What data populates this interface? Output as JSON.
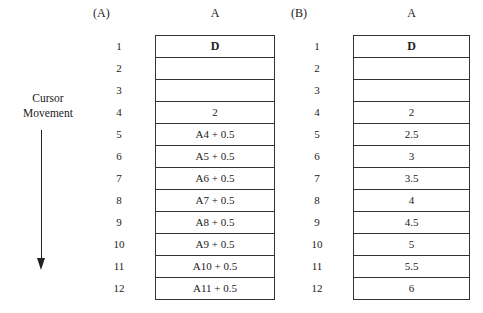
{
  "cursor": {
    "line1": "Cursor",
    "line2": "Movement",
    "direction": "down"
  },
  "panels": [
    {
      "label": "(A)",
      "column_header": "A",
      "rows": [
        {
          "num": "1",
          "value": "D",
          "bold": true
        },
        {
          "num": "2",
          "value": ""
        },
        {
          "num": "3",
          "value": ""
        },
        {
          "num": "4",
          "value": "2"
        },
        {
          "num": "5",
          "value": "A4 + 0.5"
        },
        {
          "num": "6",
          "value": "A5 + 0.5"
        },
        {
          "num": "7",
          "value": "A6 + 0.5"
        },
        {
          "num": "8",
          "value": "A7 + 0.5"
        },
        {
          "num": "9",
          "value": "A8 + 0.5"
        },
        {
          "num": "10",
          "value": "A9 + 0.5"
        },
        {
          "num": "11",
          "value": "A10 + 0.5"
        },
        {
          "num": "12",
          "value": "A11 + 0.5"
        }
      ]
    },
    {
      "label": "(B)",
      "column_header": "A",
      "rows": [
        {
          "num": "1",
          "value": "D",
          "bold": true
        },
        {
          "num": "2",
          "value": ""
        },
        {
          "num": "3",
          "value": ""
        },
        {
          "num": "4",
          "value": "2"
        },
        {
          "num": "5",
          "value": "2.5"
        },
        {
          "num": "6",
          "value": "3"
        },
        {
          "num": "7",
          "value": "3.5"
        },
        {
          "num": "8",
          "value": "4"
        },
        {
          "num": "9",
          "value": "4.5"
        },
        {
          "num": "10",
          "value": "5"
        },
        {
          "num": "11",
          "value": "5.5"
        },
        {
          "num": "12",
          "value": "6"
        }
      ]
    }
  ]
}
